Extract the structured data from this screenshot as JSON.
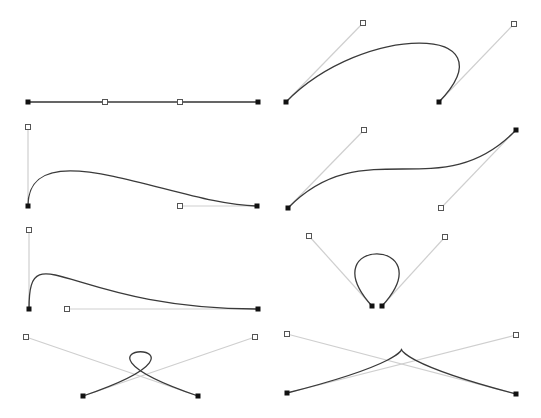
{
  "colors": {
    "background": "#ffffff",
    "curve": "#3a3a3a",
    "handle_line": "#cfcfcf",
    "anchor": "#111111",
    "handle_fill": "#ffffff",
    "handle_stroke": "#555555"
  },
  "curves": [
    {
      "id": "straight-line",
      "p0": [
        28,
        102
      ],
      "c1": [
        105,
        102
      ],
      "c2": [
        180,
        102
      ],
      "p3": [
        258,
        102
      ]
    },
    {
      "id": "arch-hook",
      "p0": [
        286,
        102
      ],
      "c1": [
        363,
        23
      ],
      "c2": [
        514,
        24
      ],
      "p3": [
        439,
        102
      ]
    },
    {
      "id": "hump-descend",
      "p0": [
        28,
        206
      ],
      "c1": [
        28,
        127
      ],
      "c2": [
        180,
        206
      ],
      "p3": [
        257,
        206
      ]
    },
    {
      "id": "s-curve",
      "p0": [
        288,
        208
      ],
      "c1": [
        364,
        130
      ],
      "c2": [
        441,
        208
      ],
      "p3": [
        516,
        130
      ]
    },
    {
      "id": "steep-hump",
      "p0": [
        29,
        309
      ],
      "c1": [
        29,
        230
      ],
      "c2": [
        67,
        309
      ],
      "p3": [
        258,
        309
      ]
    },
    {
      "id": "teardrop-loop",
      "p0": [
        372,
        306
      ],
      "c1": [
        309,
        236
      ],
      "c2": [
        445,
        237
      ],
      "p3": [
        382,
        306
      ]
    },
    {
      "id": "crossing-loop",
      "p0": [
        83,
        396
      ],
      "c1": [
        255,
        337
      ],
      "c2": [
        26,
        337
      ],
      "p3": [
        198,
        396
      ]
    },
    {
      "id": "cusp",
      "p0": [
        287,
        393
      ],
      "c1": [
        516,
        335
      ],
      "c2": [
        287,
        334
      ],
      "p3": [
        516,
        394
      ]
    }
  ]
}
